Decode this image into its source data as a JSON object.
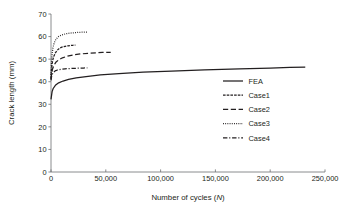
{
  "chart_data": {
    "type": "line",
    "title": "",
    "xlabel": "Number of cycles (N)",
    "xlabel_main": "Number of cycles (",
    "xlabel_italic": "N",
    "xlabel_tail": ")",
    "ylabel": "Crack length (mm)",
    "xlim": [
      0,
      250000
    ],
    "ylim": [
      0,
      70
    ],
    "grid": false,
    "legend_position": "center-right",
    "xticks": [
      0,
      50000,
      100000,
      150000,
      200000,
      250000
    ],
    "xticklabels": [
      "0",
      "50,000",
      "100,000",
      "150,000",
      "200,000",
      "250,000"
    ],
    "yticks": [
      0,
      10,
      20,
      30,
      40,
      50,
      60,
      70
    ],
    "yticklabels": [
      "0",
      "10",
      "20",
      "30",
      "40",
      "50",
      "60",
      "70"
    ],
    "axis_color": "#6d6e71",
    "series_color": "#231f20",
    "series": [
      {
        "name": "FEA",
        "style": "solid",
        "dash": "",
        "width": 1.25,
        "x": [
          0,
          1000,
          2000,
          4000,
          7000,
          11000,
          16000,
          23000,
          32000,
          45000,
          62000,
          84000,
          110000,
          140000,
          172000,
          200000,
          218000,
          232000
        ],
        "y": [
          32.2,
          35.6,
          37.0,
          38.4,
          39.5,
          40.3,
          41.0,
          41.7,
          42.3,
          43.0,
          43.6,
          44.2,
          44.7,
          45.2,
          45.7,
          46.0,
          46.3,
          46.5
        ]
      },
      {
        "name": "Case1",
        "style": "dense-dash",
        "dash": "2.6,1.1",
        "width": 1.25,
        "x": [
          0,
          400,
          900,
          1600,
          2600,
          4000,
          5800,
          8000,
          10500,
          13000,
          15500,
          18000,
          20000,
          21500,
          22300
        ],
        "y": [
          41.4,
          45.2,
          47.6,
          49.6,
          51.3,
          52.8,
          54.0,
          54.9,
          55.4,
          55.7,
          55.9,
          56.05,
          56.15,
          56.2,
          56.2
        ]
      },
      {
        "name": "Case2",
        "style": "long-dash",
        "dash": "5.2,2.6",
        "width": 1.25,
        "x": [
          0,
          600,
          1400,
          2600,
          4400,
          7000,
          10500,
          15000,
          20500,
          27000,
          34000,
          41000,
          47000,
          51500,
          54500
        ],
        "y": [
          41.1,
          43.7,
          45.6,
          47.2,
          48.6,
          49.7,
          50.6,
          51.3,
          51.9,
          52.3,
          52.6,
          52.8,
          52.95,
          53.0,
          53.05
        ]
      },
      {
        "name": "Case3",
        "style": "dotted",
        "dash": "0.9,1.3",
        "width": 1.25,
        "x": [
          0,
          400,
          900,
          1700,
          2900,
          4600,
          6900,
          9800,
          13200,
          17000,
          21000,
          25000,
          28500,
          31000,
          32800
        ],
        "y": [
          43.0,
          48.2,
          51.8,
          54.8,
          57.2,
          58.9,
          60.0,
          60.7,
          61.2,
          61.5,
          61.7,
          61.85,
          61.95,
          62.0,
          62.0
        ]
      },
      {
        "name": "Case4",
        "style": "dash-dot",
        "dash": "4.4,1.8,1.1,1.8",
        "width": 1.25,
        "x": [
          0,
          500,
          1200,
          2200,
          3800,
          6000,
          9000,
          12800,
          17200,
          21800,
          26000,
          29500,
          32000,
          33200
        ],
        "y": [
          40.6,
          42.2,
          43.3,
          44.1,
          44.8,
          45.2,
          45.5,
          45.7,
          45.85,
          45.95,
          46.0,
          46.05,
          46.1,
          46.1
        ]
      }
    ]
  },
  "legend": {
    "entries": [
      {
        "label": "FEA"
      },
      {
        "label": "Case1"
      },
      {
        "label": "Case2"
      },
      {
        "label": "Case3"
      },
      {
        "label": "Case4"
      }
    ]
  }
}
